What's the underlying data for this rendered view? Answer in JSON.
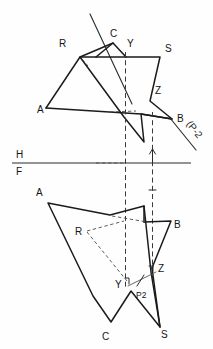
{
  "drawing": {
    "title": "Orthographic two-view descriptive geometry construction",
    "stroke_color": "#1b1b1b",
    "hidden_color": "#3a3a3a",
    "background": "#fefefe"
  },
  "reference_line": {
    "name": "HF fold line",
    "upper_label": "H",
    "lower_label": "F",
    "y": 163,
    "x_start": 12,
    "x_end": 191
  },
  "projectors": [
    {
      "name": "projector-Y",
      "x": 125.5,
      "y_top": 52,
      "y_bottom": 288
    },
    {
      "name": "projector-Z",
      "x": 152.5,
      "y_top": 112,
      "y_bottom": 278
    }
  ],
  "top_view": {
    "name": "horizontal-projection",
    "labels": [
      {
        "text": "R",
        "x": 59,
        "y": 47
      },
      {
        "text": "C",
        "x": 110,
        "y": 37
      },
      {
        "text": "Y",
        "x": 127,
        "y": 47
      },
      {
        "text": "S",
        "x": 165,
        "y": 52
      },
      {
        "text": "Z",
        "x": 155,
        "y": 94
      },
      {
        "text": "A",
        "x": 37,
        "y": 113
      },
      {
        "text": "B",
        "x": 177,
        "y": 122
      }
    ],
    "rotated_label": {
      "text": "(P-2",
      "x": 188,
      "y": 132,
      "angle": 52
    },
    "triangle_ABC": [
      [
        46,
        108
      ],
      [
        80,
        57
      ],
      [
        113,
        43
      ]
    ],
    "polygon_RSZ": [
      [
        80,
        57
      ],
      [
        160,
        57
      ],
      [
        150,
        101
      ],
      [
        172,
        119
      ],
      [
        141,
        114
      ],
      [
        144,
        142
      ],
      [
        124,
        117
      ],
      [
        80,
        57
      ]
    ],
    "aux_line": {
      "x1": 90,
      "y1": 14,
      "x2": 132,
      "y2": 104
    },
    "hidden_segs": [
      {
        "x1": 113,
        "y1": 43,
        "x2": 46,
        "y2": 108
      },
      {
        "x1": 113,
        "y1": 113,
        "x2": 136,
        "y2": 112
      }
    ]
  },
  "front_view": {
    "name": "frontal-projection",
    "labels": [
      {
        "text": "A",
        "x": 36,
        "y": 196
      },
      {
        "text": "B",
        "x": 174,
        "y": 228
      },
      {
        "text": "R",
        "x": 77,
        "y": 235
      },
      {
        "text": "Y",
        "x": 118,
        "y": 284
      },
      {
        "text": "Z",
        "x": 159,
        "y": 271
      },
      {
        "text": "P2",
        "x": 138,
        "y": 290
      },
      {
        "text": "C",
        "x": 103,
        "y": 337
      },
      {
        "text": "S",
        "x": 159,
        "y": 334
      }
    ],
    "outline": [
      [
        48,
        203
      ],
      [
        110,
        215
      ],
      [
        144,
        206
      ],
      [
        151,
        272
      ],
      [
        160,
        327
      ],
      [
        131,
        291
      ],
      [
        111,
        322
      ],
      [
        93,
        296
      ],
      [
        48,
        203
      ]
    ],
    "spur_B": [
      [
        144,
        222
      ],
      [
        171,
        221
      ],
      [
        152,
        268
      ]
    ],
    "hidden_segs": [
      {
        "x1": 86,
        "y1": 231,
        "x2": 122,
        "y2": 222
      },
      {
        "x1": 86,
        "y1": 231,
        "x2": 128,
        "y2": 280
      },
      {
        "x1": 110,
        "y1": 215,
        "x2": 146,
        "y2": 221
      }
    ],
    "p2_lead": {
      "x1": 129,
      "y1": 285,
      "x2": 155,
      "y2": 272
    },
    "p2_tick": {
      "x1": 138,
      "y1": 285,
      "x2": 144,
      "y2": 275
    }
  }
}
